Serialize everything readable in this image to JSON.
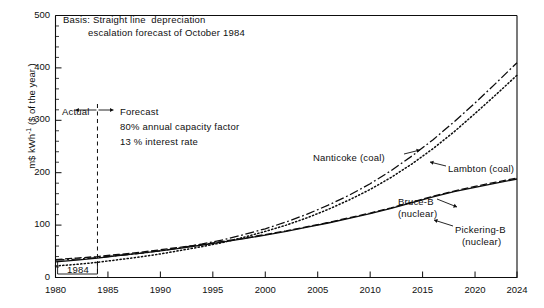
{
  "chart_data": {
    "type": "line",
    "title": "Basis: Straight line depreciation escalation forecast of October 1984",
    "title_line1": "Basis: Straight line  depreciation",
    "title_line2": "escalation forecast of October 1984",
    "xlabel": "",
    "ylabel": "m$ kWh⁻¹ ($ of the year)",
    "ylabel_main": "m$ kWh",
    "ylabel_sup": "-1",
    "ylabel_paren": "($ of the year )",
    "xlim": [
      1980,
      2024
    ],
    "ylim": [
      0,
      500
    ],
    "xticks": [
      1980,
      1985,
      1990,
      1995,
      2000,
      2005,
      2010,
      2015,
      2020,
      2024
    ],
    "yticks": [
      0,
      100,
      200,
      300,
      400,
      500
    ],
    "y_minor_step": 20,
    "grid": false,
    "legend_position": "inline-annotations",
    "series": [
      {
        "name": "Nanticoke (coal)",
        "style": "dash-dot",
        "label": "Nanticoke (coal)",
        "x": [
          1980,
          1982,
          1984,
          1986,
          1988,
          1990,
          1992,
          1994,
          1996,
          1998,
          2000,
          2002,
          2004,
          2006,
          2008,
          2010,
          2012,
          2014,
          2016,
          2018,
          2020,
          2022,
          2024
        ],
        "y": [
          33,
          35,
          38,
          42,
          46,
          51,
          57,
          64,
          72,
          82,
          93,
          106,
          121,
          138,
          157,
          179,
          204,
          232,
          263,
          297,
          333,
          371,
          410
        ]
      },
      {
        "name": "Lambton (coal)",
        "style": "dotted",
        "label": "Lambton (coal)",
        "x": [
          1980,
          1982,
          1984,
          1986,
          1988,
          1990,
          1992,
          1994,
          1996,
          1998,
          2000,
          2002,
          2004,
          2006,
          2008,
          2010,
          2012,
          2014,
          2016,
          2018,
          2020,
          2022,
          2024
        ],
        "y": [
          22,
          25,
          29,
          34,
          39,
          45,
          52,
          59,
          67,
          77,
          88,
          100,
          114,
          130,
          148,
          168,
          191,
          217,
          246,
          278,
          313,
          349,
          386
        ]
      },
      {
        "name": "Bruce-B (nuclear)",
        "style": "solid",
        "label_line1": "Bruce-B",
        "label_line2": "(nuclear)",
        "x": [
          1980,
          1982,
          1984,
          1986,
          1988,
          1990,
          1992,
          1994,
          1996,
          1998,
          2000,
          2002,
          2004,
          2006,
          2008,
          2010,
          2012,
          2014,
          2016,
          2018,
          2020,
          2022,
          2024
        ],
        "y": [
          30,
          33,
          37,
          42,
          46,
          51,
          56,
          62,
          68,
          74,
          81,
          88,
          96,
          104,
          113,
          122,
          132,
          143,
          154,
          164,
          172,
          180,
          188
        ]
      },
      {
        "name": "Pickering-B (nuclear)",
        "style": "dashed",
        "label_line1": "Pickering-B",
        "label_line2": "(nuclear)",
        "x": [
          1980,
          1982,
          1984,
          1986,
          1988,
          1990,
          1992,
          1994,
          1996,
          1998,
          2000,
          2002,
          2004,
          2006,
          2008,
          2010,
          2012,
          2014,
          2016,
          2018,
          2020,
          2022,
          2024
        ],
        "y": [
          34,
          37,
          40,
          44,
          48,
          53,
          58,
          63,
          69,
          75,
          82,
          89,
          97,
          105,
          114,
          123,
          133,
          144,
          155,
          165,
          174,
          182,
          190
        ]
      }
    ],
    "annotations": {
      "actual": "Actual",
      "forecast": "Forecast",
      "capacity": "80% annual capacity factor",
      "interest": "13 % interest rate",
      "divider_year": "1984",
      "divider_x": 1984
    }
  }
}
